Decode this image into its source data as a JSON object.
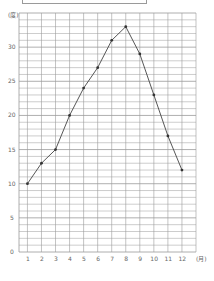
{
  "chart_data": {
    "type": "line",
    "title": "",
    "xlabel": "(月)",
    "ylabel": "(度)",
    "categories": [
      "1",
      "2",
      "3",
      "4",
      "5",
      "6",
      "7",
      "8",
      "9",
      "10",
      "11",
      "12"
    ],
    "series": [
      {
        "name": "temperature",
        "values": [
          10,
          13,
          15,
          20,
          24,
          27,
          31,
          33,
          29,
          23,
          17,
          12
        ]
      }
    ],
    "ylim": [
      0,
      35
    ],
    "yticks": [
      0,
      5,
      10,
      15,
      20,
      25,
      30
    ],
    "grid": true,
    "legend": "none"
  },
  "colors": {
    "grid": "#9a9a9a",
    "line": "#444444",
    "marker": "#333333",
    "text": "#666666"
  }
}
